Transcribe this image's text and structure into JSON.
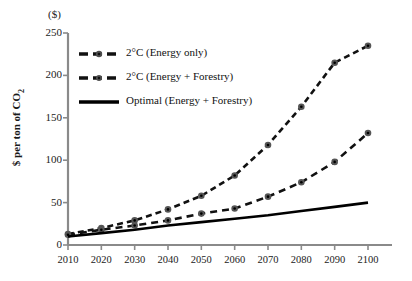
{
  "chart_data": {
    "type": "line",
    "title": "",
    "subtitle": "",
    "unit_label": "($)",
    "xlabel": "",
    "ylabel": "$ per ton of CO2",
    "x": [
      2010,
      2020,
      2030,
      2040,
      2050,
      2060,
      2070,
      2080,
      2090,
      2100
    ],
    "xticklabels": [
      "2010",
      "2020",
      "2030",
      "2040",
      "2050",
      "2060",
      "2070",
      "2080",
      "2090",
      "2100"
    ],
    "yticklabels": [
      "0",
      "50",
      "100",
      "150",
      "200",
      "250"
    ],
    "yticks": [
      0,
      50,
      100,
      150,
      200,
      250
    ],
    "ylim": [
      0,
      250
    ],
    "xlim": [
      2010,
      2100
    ],
    "grid": false,
    "legend_position": "upper-left-inside",
    "series": [
      {
        "name": "2°C (Energy only)",
        "style": "dashed-markers",
        "color": "#111111",
        "values": [
          13,
          20,
          29,
          42,
          58,
          82,
          118,
          163,
          215,
          235
        ]
      },
      {
        "name": "2°C (Energy + Forestry)",
        "style": "dashed-markers",
        "color": "#111111",
        "values": [
          12,
          18,
          23,
          29,
          37,
          43,
          57,
          74,
          98,
          132
        ]
      },
      {
        "name": "Optimal (Energy + Forestry)",
        "style": "solid",
        "color": "#000000",
        "values": [
          10,
          14,
          18,
          23,
          27,
          31,
          35,
          40,
          45,
          50
        ]
      }
    ]
  },
  "legend": {
    "items": [
      {
        "label": "2°C (Energy only)",
        "key": "dashed-marker-key"
      },
      {
        "label": "2°C (Energy + Forestry)",
        "key": "dashed-marker-key"
      },
      {
        "label": "Optimal (Energy + Forestry)",
        "key": "solid-line-key"
      }
    ]
  },
  "axes": {
    "unit_label": "($)",
    "y_axis_title": "$ per ton of CO",
    "y_axis_title_sub": "2"
  }
}
